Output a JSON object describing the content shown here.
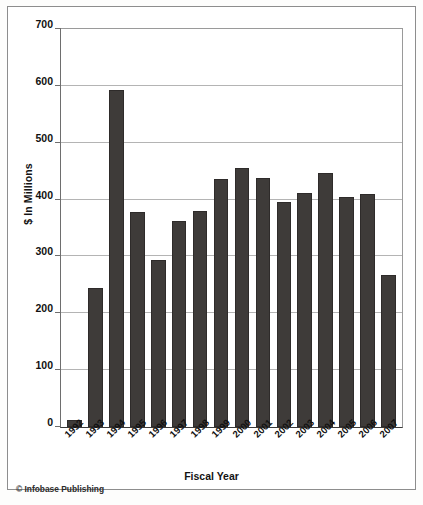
{
  "chart_data": {
    "type": "bar",
    "title": "",
    "xlabel": "Fiscal Year",
    "ylabel": "$ In Millions",
    "ylim": [
      0,
      700
    ],
    "yticks": [
      0,
      100,
      200,
      300,
      400,
      500,
      600,
      700
    ],
    "grid": true,
    "legend": null,
    "bar_color": "#3e3b39",
    "categories": [
      "1992",
      "1993",
      "1994",
      "1995",
      "1996",
      "1997",
      "1998",
      "1999",
      "2000",
      "2001",
      "2002",
      "2003",
      "2004",
      "2005",
      "2006",
      "2007"
    ],
    "values": [
      13,
      245,
      592,
      378,
      294,
      362,
      380,
      437,
      456,
      438,
      396,
      411,
      446,
      404,
      409,
      268
    ]
  },
  "credit": "© Infobase Publishing"
}
